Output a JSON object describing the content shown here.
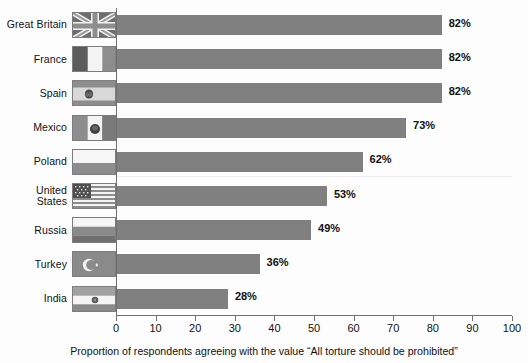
{
  "chart_data": {
    "type": "bar",
    "orientation": "horizontal",
    "title": "",
    "xlabel": "Proportion of respondents agreeing with the value “All torture should be prohibited”",
    "ylabel": "",
    "xlim": [
      0,
      100
    ],
    "xticks": [
      0,
      10,
      20,
      30,
      40,
      50,
      60,
      70,
      80,
      90,
      100
    ],
    "grid": false,
    "legend": "none",
    "value_suffix": "%",
    "bar_color": "#808080",
    "categories": [
      "Great Britain",
      "France",
      "Spain",
      "Mexico",
      "Poland",
      "United\nStates",
      "Russia",
      "Turkey",
      "India"
    ],
    "values": [
      82,
      82,
      82,
      73,
      62,
      53,
      49,
      36,
      28
    ],
    "value_labels": [
      "82%",
      "82%",
      "82%",
      "73%",
      "62%",
      "53%",
      "49%",
      "36%",
      "28%"
    ]
  },
  "rows": [
    {
      "label": "Great Britain",
      "value": 82,
      "value_label": "82%",
      "flag": "flag-great-britain"
    },
    {
      "label": "France",
      "value": 82,
      "value_label": "82%",
      "flag": "flag-france"
    },
    {
      "label": "Spain",
      "value": 82,
      "value_label": "82%",
      "flag": "flag-spain"
    },
    {
      "label": "Mexico",
      "value": 73,
      "value_label": "73%",
      "flag": "flag-mexico"
    },
    {
      "label": "Poland",
      "value": 62,
      "value_label": "62%",
      "flag": "flag-poland"
    },
    {
      "label": "United\nStates",
      "value": 53,
      "value_label": "53%",
      "flag": "flag-united-states"
    },
    {
      "label": "Russia",
      "value": 49,
      "value_label": "49%",
      "flag": "flag-russia"
    },
    {
      "label": "Turkey",
      "value": 36,
      "value_label": "36%",
      "flag": "flag-turkey"
    },
    {
      "label": "India",
      "value": 28,
      "value_label": "28%",
      "flag": "flag-india"
    }
  ],
  "axis": {
    "tick_labels": [
      "0",
      "10",
      "20",
      "30",
      "40",
      "50",
      "60",
      "70",
      "80",
      "90",
      "100"
    ],
    "title": "Proportion of respondents agreeing with the value “All torture should be prohibited”"
  }
}
